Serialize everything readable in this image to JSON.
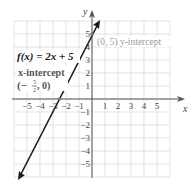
{
  "chart_data": {
    "type": "line",
    "title": "",
    "function_label": "f(x) = 2x + 5",
    "xlabel": "x",
    "ylabel": "y",
    "xlim": [
      -6,
      6
    ],
    "ylim": [
      -6,
      6
    ],
    "grid": true,
    "x_ticks": [
      "-5",
      "-4",
      "-3",
      "-2",
      "-1",
      "1",
      "2",
      "3",
      "4",
      "5"
    ],
    "y_ticks": [
      "5",
      "4",
      "3",
      "2",
      "1",
      "-1",
      "-2",
      "-3",
      "-4",
      "-5"
    ],
    "series": [
      {
        "name": "f(x) = 2x + 5",
        "x": [
          -5.5,
          0.5
        ],
        "y": [
          -6,
          6
        ]
      }
    ],
    "annotations": [
      {
        "text": "(0, 5) y-intercept",
        "point": [
          0,
          5
        ]
      },
      {
        "text": "x-intercept (-5/2, 0)",
        "point": [
          -2.5,
          0
        ]
      }
    ]
  },
  "labels": {
    "function": "f(x) = 2x + 5",
    "y_intercept": "(0, 5) y-intercept",
    "x_intercept_title": "x-intercept",
    "x_intercept_value_open": "(−",
    "x_intercept_frac_num": "5",
    "x_intercept_frac_den": "2",
    "x_intercept_value_close": ", 0)",
    "x_axis": "x",
    "y_axis": "y"
  },
  "colors": {
    "grid": "#d6d6d6",
    "axis": "#555555",
    "line": "#1a1a1a",
    "annotation_gray": "#9a9a9a"
  }
}
